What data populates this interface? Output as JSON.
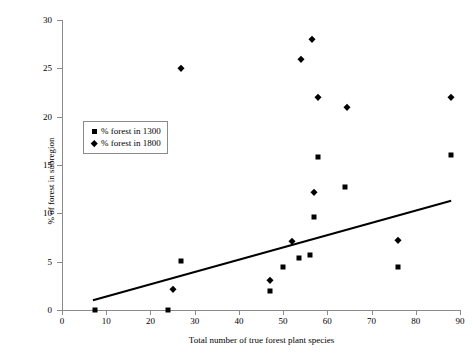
{
  "chart_data": {
    "type": "scatter",
    "title": "",
    "xlabel": "Total number of true forest plant species",
    "ylabel": "% of forest in subregion",
    "xlim": [
      0,
      90
    ],
    "ylim": [
      0,
      30
    ],
    "xticks": [
      0,
      10,
      20,
      30,
      40,
      50,
      60,
      70,
      80,
      90
    ],
    "yticks": [
      0,
      5,
      10,
      15,
      20,
      25,
      30
    ],
    "grid": false,
    "legend_position": "upper-left-inside",
    "series": [
      {
        "name": "% forest in 1300",
        "marker": "square",
        "color": "#000000",
        "points": [
          [
            7.5,
            0
          ],
          [
            24,
            0
          ],
          [
            27,
            5.1
          ],
          [
            47,
            2.0
          ],
          [
            50,
            4.4
          ],
          [
            53.5,
            5.4
          ],
          [
            56,
            5.7
          ],
          [
            57,
            9.6
          ],
          [
            58,
            15.8
          ],
          [
            64,
            12.7
          ],
          [
            76,
            4.4
          ],
          [
            88,
            16.0
          ]
        ]
      },
      {
        "name": "% forest in 1800",
        "marker": "diamond",
        "color": "#000000",
        "points": [
          [
            25,
            2.2
          ],
          [
            27,
            25.0
          ],
          [
            47,
            3.1
          ],
          [
            52,
            7.1
          ],
          [
            54,
            26.0
          ],
          [
            56.5,
            28.0
          ],
          [
            57,
            12.2
          ],
          [
            58,
            22.0
          ],
          [
            64.5,
            21.0
          ],
          [
            76,
            7.2
          ],
          [
            88,
            22.0
          ]
        ]
      }
    ],
    "trendline": {
      "name": "linear-fit",
      "color": "#000000",
      "x0": 7,
      "y0": 1.0,
      "x1": 88,
      "y1": 11.3
    }
  },
  "legend": {
    "items": [
      {
        "label": "% forest in 1300",
        "marker": "square"
      },
      {
        "label": "% forest in 1800",
        "marker": "diamond"
      }
    ]
  }
}
